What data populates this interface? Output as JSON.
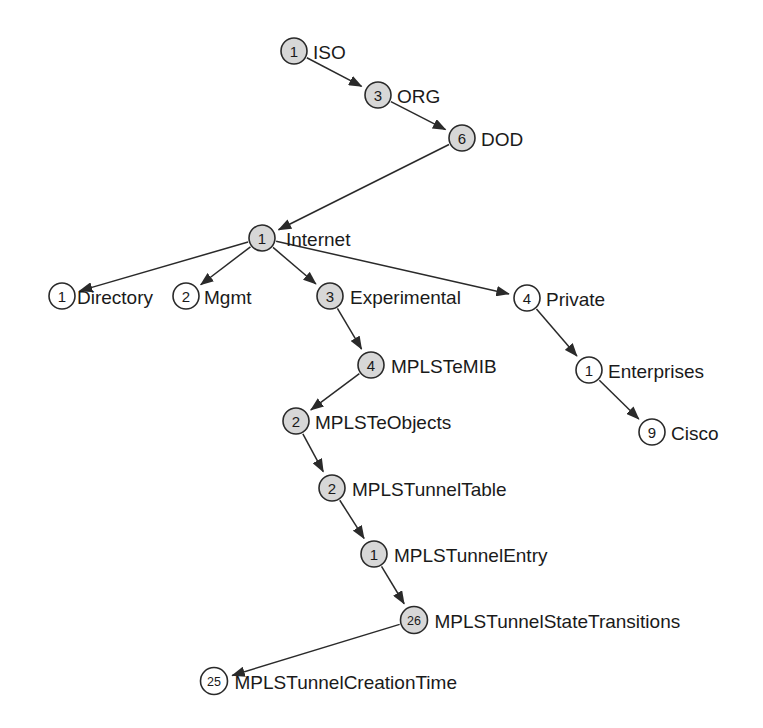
{
  "diagram": {
    "type": "tree",
    "background_color": "#ffffff",
    "node_fill_filled": "#d7d7d7",
    "node_fill_hollow": "#ffffff",
    "stroke_color": "#2a2a2a",
    "canvas": {
      "width": 763,
      "height": 728
    },
    "nodes": [
      {
        "id": "iso",
        "number": "1",
        "label": "ISO",
        "x": 294,
        "y": 51,
        "r": 13,
        "fill": "filled",
        "label_dx": 19
      },
      {
        "id": "org",
        "number": "3",
        "label": "ORG",
        "x": 378,
        "y": 95,
        "r": 13,
        "fill": "filled",
        "label_dx": 19
      },
      {
        "id": "dod",
        "number": "6",
        "label": "DOD",
        "x": 462,
        "y": 138,
        "r": 13,
        "fill": "filled",
        "label_dx": 19
      },
      {
        "id": "internet",
        "number": "1",
        "label": "Internet",
        "x": 262,
        "y": 238,
        "r": 13,
        "fill": "filled",
        "label_dx": 24
      },
      {
        "id": "directory",
        "number": "1",
        "label": "Directory",
        "x": 62,
        "y": 296,
        "r": 13,
        "fill": "hollow",
        "label_dx": 15
      },
      {
        "id": "mgmt",
        "number": "2",
        "label": "Mgmt",
        "x": 186,
        "y": 296,
        "r": 13,
        "fill": "hollow",
        "label_dx": 18
      },
      {
        "id": "experimental",
        "number": "3",
        "label": "Experimental",
        "x": 330,
        "y": 296,
        "r": 13,
        "fill": "filled",
        "label_dx": 20
      },
      {
        "id": "private",
        "number": "4",
        "label": "Private",
        "x": 527,
        "y": 298,
        "r": 13,
        "fill": "hollow",
        "label_dx": 19
      },
      {
        "id": "mplstemib",
        "number": "4",
        "label": "MPLSTeMIB",
        "x": 371,
        "y": 365,
        "r": 13,
        "fill": "filled",
        "label_dx": 20
      },
      {
        "id": "enterprises",
        "number": "1",
        "label": "Enterprises",
        "x": 589,
        "y": 370,
        "r": 13,
        "fill": "hollow",
        "label_dx": 19
      },
      {
        "id": "mplsteobjects",
        "number": "2",
        "label": "MPLSTeObjects",
        "x": 296,
        "y": 421,
        "r": 13,
        "fill": "filled",
        "label_dx": 19
      },
      {
        "id": "cisco",
        "number": "9",
        "label": "Cisco",
        "x": 652,
        "y": 432,
        "r": 13,
        "fill": "hollow",
        "label_dx": 19
      },
      {
        "id": "mplstunneltable",
        "number": "2",
        "label": "MPLSTunnelTable",
        "x": 332,
        "y": 488,
        "r": 13,
        "fill": "filled",
        "label_dx": 20
      },
      {
        "id": "mplstunnelentry",
        "number": "1",
        "label": "MPLSTunnelEntry",
        "x": 374,
        "y": 554,
        "r": 13,
        "fill": "filled",
        "label_dx": 20
      },
      {
        "id": "mplstunnelstatetransitions",
        "number": "26",
        "label": "MPLSTunnelStateTransitions",
        "x": 414,
        "y": 620,
        "r": 13.5,
        "fill": "filled",
        "label_dx": 20
      },
      {
        "id": "mplstunnelcreationtime",
        "number": "25",
        "label": "MPLSTunnelCreationTime",
        "x": 214,
        "y": 681,
        "r": 13.5,
        "fill": "hollow",
        "label_dx": 20
      }
    ],
    "edges": [
      {
        "from": "iso",
        "to": "org"
      },
      {
        "from": "org",
        "to": "dod"
      },
      {
        "from": "dod",
        "to": "internet"
      },
      {
        "from": "internet",
        "to": "directory"
      },
      {
        "from": "internet",
        "to": "mgmt"
      },
      {
        "from": "internet",
        "to": "experimental"
      },
      {
        "from": "internet",
        "to": "private"
      },
      {
        "from": "experimental",
        "to": "mplstemib"
      },
      {
        "from": "mplstemib",
        "to": "mplsteobjects"
      },
      {
        "from": "mplsteobjects",
        "to": "mplstunneltable"
      },
      {
        "from": "mplstunneltable",
        "to": "mplstunnelentry"
      },
      {
        "from": "mplstunnelentry",
        "to": "mplstunnelstatetransitions"
      },
      {
        "from": "mplstunnelstatetransitions",
        "to": "mplstunnelcreationtime"
      },
      {
        "from": "private",
        "to": "enterprises"
      },
      {
        "from": "enterprises",
        "to": "cisco"
      }
    ]
  }
}
